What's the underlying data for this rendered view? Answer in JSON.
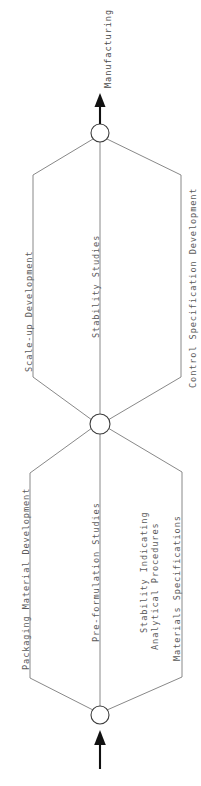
{
  "diagram": {
    "type": "pert-network",
    "orientation": "rotated-90-ccw",
    "background_color": "#ffffff",
    "line_color": "#7b7b7b",
    "node_stroke_color": "#3c3c3c",
    "text_color": "#5a5a5a",
    "arrow_color": "#111111"
  },
  "nodes": [
    {
      "id": "start",
      "label": "",
      "cx": 100,
      "cy": 715,
      "r": 9
    },
    {
      "id": "middle",
      "label": "",
      "cx": 100,
      "cy": 424,
      "r": 10
    },
    {
      "id": "end",
      "label": "",
      "cx": 100,
      "cy": 133,
      "r": 9
    }
  ],
  "arrows": {
    "input": {
      "name": "input-arrow",
      "label": ""
    },
    "output": {
      "name": "output-arrow",
      "label": "Manufacturing"
    }
  },
  "labels": {
    "manufacturing": "Manufacturing",
    "scale_up_development": "Scale-up Development",
    "stability_studies": "Stability Studies",
    "control_specification_development": "Control Specification Development",
    "packaging_material_development": "Packaging Material Development",
    "pre_formulation_studies": "Pre-formulation Studies",
    "stability_indicating_line1": "Stability Indicating",
    "stability_indicating_line2": "Analytical Procedures",
    "materials_specifications": "Materials Specifications"
  },
  "stages": [
    {
      "name": "stage-1",
      "from_node": "start",
      "to_node": "middle",
      "activities": [
        "Packaging Material Development",
        "Pre-formulation Studies",
        "Stability Indicating Analytical Procedures",
        "Materials Specifications"
      ]
    },
    {
      "name": "stage-2",
      "from_node": "middle",
      "to_node": "end",
      "activities": [
        "Scale-up Development",
        "Stability Studies",
        "Control Specification Development"
      ]
    }
  ]
}
